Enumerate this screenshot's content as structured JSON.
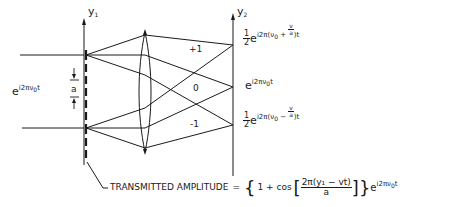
{
  "diagram": {
    "colors": {
      "ink": "#1a1a1a",
      "background": "#ffffff"
    },
    "axes": {
      "input_plane": {
        "label": "y",
        "subscript": "1"
      },
      "output_plane": {
        "label": "y",
        "subscript": "2"
      }
    },
    "input_wave": {
      "base": "e",
      "exponent": "i2πν",
      "exponent_sub": "0",
      "exponent_tail": "t"
    },
    "period_label": "a",
    "orders": [
      {
        "label": "+1",
        "coef_num": "1",
        "coef_den": "2",
        "base": "e",
        "exp_prefix": "i2π(ν",
        "exp_sub": "0",
        "exp_op": " + ",
        "frac_num": "v",
        "frac_den": "a",
        "exp_suffix": ")t"
      },
      {
        "label": "0",
        "base": "e",
        "exp_prefix": "i2πν",
        "exp_sub": "0",
        "exp_suffix": "t"
      },
      {
        "label": "-1",
        "coef_num": "1",
        "coef_den": "2",
        "base": "e",
        "exp_prefix": "i2π(ν",
        "exp_sub": "0",
        "exp_op": " − ",
        "frac_num": "v",
        "frac_den": "a",
        "exp_suffix": ")t"
      }
    ],
    "caption": {
      "label": "TRANSMITTED AMPLITUDE",
      "equals": "=",
      "open_brace": "{",
      "one_plus_cos": "1 + cos",
      "open_bracket": "[",
      "frac_num": "2π(y₁ − vt)",
      "frac_den": "a",
      "close_bracket": "]",
      "close_brace": "}",
      "tail_base": "e",
      "tail_exp": "i2πν",
      "tail_exp_sub": "0",
      "tail_exp_suffix": "t"
    }
  }
}
